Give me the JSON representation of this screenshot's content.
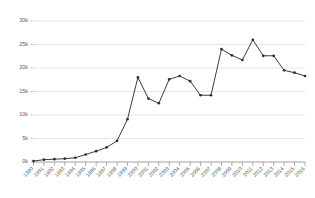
{
  "chart_data": {
    "type": "line",
    "title": "",
    "subtitle": "",
    "xlabel": "",
    "ylabel": "",
    "grid": true,
    "legend": false,
    "legend_position": "none",
    "marker": "circle",
    "line_color": "#3d3d3d",
    "marker_color": "#2e2e2e",
    "gridline_color": "#d9d9d9",
    "axis_color": "#8c8c8c",
    "background_color": "#ffffff",
    "x_tick_rotation": -45,
    "ylim": [
      0,
      30000
    ],
    "ytick_values": [
      0,
      5000,
      10000,
      15000,
      20000,
      25000,
      30000
    ],
    "ytick_labels": [
      "0k",
      "5k",
      "10k",
      "15k",
      "20k",
      "25k",
      "30k"
    ],
    "categories": [
      "1990",
      "1991",
      "1992",
      "1993",
      "1994",
      "1995",
      "1996",
      "1997",
      "1998",
      "1999",
      "2000",
      "2001",
      "2002",
      "2003",
      "2004",
      "2005",
      "2006",
      "2007",
      "2008",
      "2009",
      "2010",
      "2011",
      "2012",
      "2013",
      "2014",
      "2015",
      "2016"
    ],
    "values": [
      200,
      500,
      600,
      700,
      900,
      1600,
      2300,
      3100,
      4500,
      9100,
      18000,
      13500,
      12500,
      17600,
      18300,
      17200,
      14200,
      14200,
      24000,
      22700,
      21700,
      26000,
      22600,
      22600,
      19500,
      19000,
      18300
    ]
  }
}
